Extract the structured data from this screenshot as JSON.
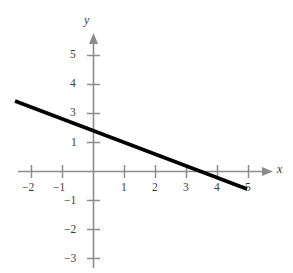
{
  "chart_data": {
    "type": "line",
    "title": "",
    "xlabel": "x",
    "ylabel": "y",
    "grid": false,
    "legend": null,
    "xlim": [
      -2.6,
      6.5
    ],
    "ylim": [
      -3.6,
      5.8
    ],
    "x_ticks": [
      -2,
      -1,
      1,
      2,
      3,
      4,
      5,
      6
    ],
    "x_tick_labels": [
      "−2",
      "−1",
      "1",
      "2",
      "3",
      "4",
      "5",
      ""
    ],
    "y_ticks": [
      -3,
      -2,
      -1,
      1,
      2,
      3,
      4,
      5
    ],
    "y_tick_labels": [
      "−3",
      "−2",
      "−1",
      "1",
      "",
      "3",
      "4",
      "5"
    ],
    "series": [
      {
        "name": "line",
        "points": [
          [
            -2.5,
            2.95
          ],
          [
            4.9,
            0.05
          ],
          [
            5.9,
            -0.52
          ]
        ],
        "x_intercept": 5.1,
        "y_intercept": 2.05,
        "slope": -0.4,
        "equation": "y = -0.4x + 2",
        "color": "#000000",
        "linewidth": 3.4
      }
    ],
    "axis_color": "#8c8c8c",
    "label_color": "#3b3b3b",
    "background": "#ffffff"
  },
  "axes": {
    "y_axis_label": "y",
    "x_axis_label": "x"
  },
  "ticks": {
    "x": [
      {
        "value": -2,
        "label": "−2",
        "px": 31
      },
      {
        "value": -1,
        "label": "−1",
        "px": 62
      },
      {
        "value": 1,
        "label": "1",
        "px": 124
      },
      {
        "value": 2,
        "label": "2",
        "px": 155
      },
      {
        "value": 3,
        "label": "3",
        "px": 186
      },
      {
        "value": 4,
        "label": "4",
        "px": 217
      },
      {
        "value": 5,
        "label": "5",
        "px": 217
      },
      {
        "value": 6,
        "label": "",
        "px": 248
      }
    ],
    "y": [
      {
        "value": 5,
        "label": "5",
        "px": 55
      },
      {
        "value": 4,
        "label": "4",
        "px": 84
      },
      {
        "value": 3,
        "label": "3",
        "px": 113
      },
      {
        "value": 2,
        "label": "",
        "px": 142
      },
      {
        "value": 1,
        "label": "1",
        "px": 143
      },
      {
        "value": -1,
        "label": "−1",
        "px": 201
      },
      {
        "value": -2,
        "label": "−2",
        "px": 230
      },
      {
        "value": -3,
        "label": "−3",
        "px": 259
      }
    ]
  }
}
